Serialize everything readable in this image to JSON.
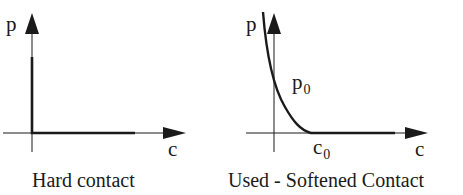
{
  "panels": [
    {
      "id": "hard",
      "caption": "Hard contact",
      "y_axis_label": "p",
      "x_axis_label": "c"
    },
    {
      "id": "softened",
      "caption": "Used - Softened Contact",
      "y_axis_label": "p",
      "x_axis_label": "c",
      "curve_label_main": "p",
      "curve_label_sub": "0",
      "x_marker_main": "c",
      "x_marker_sub": "0"
    }
  ],
  "colors": {
    "ink": "#1a1a1a",
    "background": "#ffffff"
  }
}
